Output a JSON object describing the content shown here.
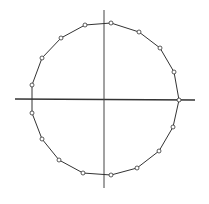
{
  "diagram": {
    "type": "polygon-on-axes",
    "colors": {
      "background": "#ffffff",
      "stroke": "#333333",
      "marker_fill": "#ffffff"
    },
    "axes": {
      "horizontal": {
        "x1": 15,
        "y1": 99,
        "x2": 195,
        "y2": 100
      },
      "vertical": {
        "x1": 104,
        "y1": 10,
        "x2": 104,
        "y2": 188
      }
    },
    "vertices": [
      [
        111,
        23
      ],
      [
        139,
        32
      ],
      [
        160,
        48
      ],
      [
        174,
        72
      ],
      [
        179,
        100
      ],
      [
        173,
        127
      ],
      [
        159,
        151
      ],
      [
        137,
        168
      ],
      [
        111,
        175
      ],
      [
        83,
        173
      ],
      [
        59,
        160
      ],
      [
        42,
        139
      ],
      [
        32,
        113
      ],
      [
        32,
        85
      ],
      [
        42,
        58
      ],
      [
        61,
        38
      ],
      [
        85,
        25
      ]
    ],
    "marker_radius": 2
  }
}
